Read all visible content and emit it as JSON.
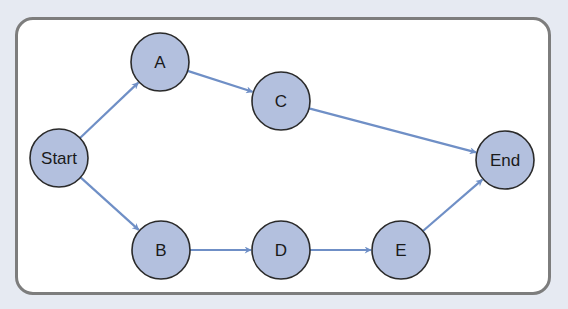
{
  "diagram": {
    "type": "directed-graph",
    "colors": {
      "background": "#e6eaf2",
      "frame_fill": "#ffffff",
      "frame_border": "#7d7d7d",
      "node_fill": "#b3c0de",
      "node_stroke": "#2a2a2a",
      "edge": "#6f8fc6"
    },
    "nodes": [
      {
        "id": "start",
        "label": "Start",
        "x": 59,
        "y": 158
      },
      {
        "id": "a",
        "label": "A",
        "x": 160,
        "y": 62
      },
      {
        "id": "c",
        "label": "C",
        "x": 281,
        "y": 101
      },
      {
        "id": "end",
        "label": "End",
        "x": 505,
        "y": 160
      },
      {
        "id": "b",
        "label": "B",
        "x": 161,
        "y": 250
      },
      {
        "id": "d",
        "label": "D",
        "x": 281,
        "y": 250
      },
      {
        "id": "e",
        "label": "E",
        "x": 401,
        "y": 250
      }
    ],
    "edges": [
      {
        "from": "start",
        "to": "a"
      },
      {
        "from": "a",
        "to": "c"
      },
      {
        "from": "c",
        "to": "end"
      },
      {
        "from": "start",
        "to": "b"
      },
      {
        "from": "b",
        "to": "d"
      },
      {
        "from": "d",
        "to": "e"
      },
      {
        "from": "e",
        "to": "end"
      }
    ]
  }
}
